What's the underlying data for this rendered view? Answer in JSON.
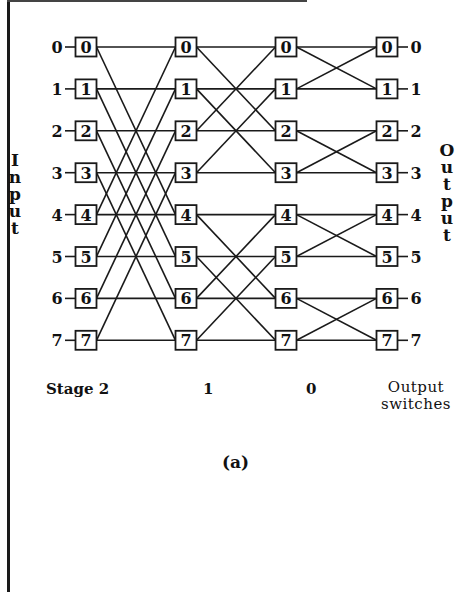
{
  "figure": {
    "caption": "(a)",
    "input_label": "Input",
    "output_label": "Output",
    "stage_labels": [
      "Stage 2",
      "1",
      "0"
    ],
    "output_switches_label": [
      "Output",
      "switches"
    ],
    "input_numbers": [
      "0",
      "1",
      "2",
      "3",
      "4",
      "5",
      "6",
      "7"
    ],
    "output_numbers": [
      "0",
      "1",
      "2",
      "3",
      "4",
      "5",
      "6",
      "7"
    ],
    "columns": [
      {
        "name": "stage-2",
        "nodes": [
          "0",
          "1",
          "2",
          "3",
          "4",
          "5",
          "6",
          "7"
        ]
      },
      {
        "name": "stage-1",
        "nodes": [
          "0",
          "1",
          "2",
          "3",
          "4",
          "5",
          "6",
          "7"
        ]
      },
      {
        "name": "stage-0",
        "nodes": [
          "0",
          "1",
          "2",
          "3",
          "4",
          "5",
          "6",
          "7"
        ]
      },
      {
        "name": "output-switches",
        "nodes": [
          "0",
          "1",
          "2",
          "3",
          "4",
          "5",
          "6",
          "7"
        ]
      }
    ],
    "butterfly_distances": [
      4,
      2,
      1
    ],
    "line_color": "#1a1a1a"
  }
}
